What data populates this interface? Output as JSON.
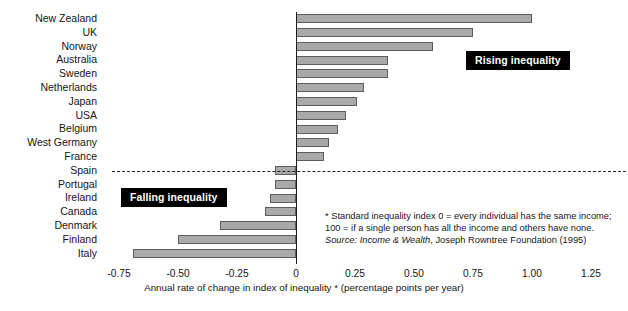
{
  "chart_data": {
    "type": "bar",
    "orientation": "horizontal",
    "title": "",
    "xlabel": "Annual rate of change in index of inequality * (percentage points per year)",
    "ylabel": "",
    "xlim": [
      -0.85,
      1.35
    ],
    "xticks": [
      "-0.75",
      "-0.50",
      "-0.25",
      "0",
      "0.25",
      "0.50",
      "0.75",
      "1.00",
      "1.25"
    ],
    "xtick_values": [
      -0.75,
      -0.5,
      -0.25,
      0,
      0.25,
      0.5,
      0.75,
      1.0,
      1.25
    ],
    "grid": false,
    "legend": "none",
    "categories": [
      "New Zealand",
      "UK",
      "Norway",
      "Australia",
      "Sweden",
      "Netherlands",
      "Japan",
      "USA",
      "Belgium",
      "West Germany",
      "France",
      "Spain",
      "Portugal",
      "Ireland",
      "Canada",
      "Denmark",
      "Finland",
      "Italy"
    ],
    "values": [
      1.0,
      0.75,
      0.58,
      0.39,
      0.39,
      0.29,
      0.26,
      0.21,
      0.18,
      0.14,
      0.12,
      -0.09,
      -0.09,
      -0.11,
      -0.13,
      -0.32,
      -0.5,
      -0.69
    ],
    "bar_color": "#a9a9a9",
    "bar_border_color": "#5d5d5d",
    "annotations": [
      {
        "id": "rising",
        "text": "Rising inequality"
      },
      {
        "id": "falling",
        "text": "Falling inequality"
      }
    ],
    "divider": {
      "value": 0,
      "between": [
        "France",
        "Spain"
      ],
      "style": "dashed"
    }
  },
  "callouts": {
    "rising": "Rising inequality",
    "falling": "Falling inequality"
  },
  "footnote": {
    "line1": "* Standard inequality index 0 = every individual has the same income;",
    "line2": "100 = if a single person has all the income and others have none.",
    "source_lead": "Source:",
    "source_title": "Income & Wealth",
    "source_rest": ", Joseph Rowntree Foundation (1995)"
  },
  "axis": {
    "x_title": "Annual rate of change in index of inequality * (percentage points per year)"
  }
}
